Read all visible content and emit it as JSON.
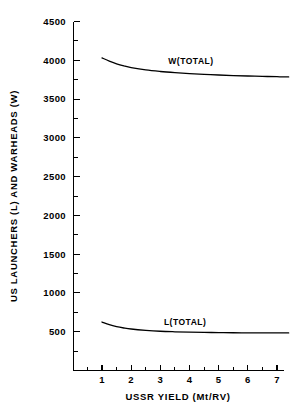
{
  "chart_data": {
    "type": "line",
    "title": "",
    "xlabel": "USSR YIELD (Mt/RV)",
    "ylabel": "US LAUNCHERS (L) AND WARHEADS (W)",
    "xlim": [
      0,
      7.45
    ],
    "ylim": [
      0,
      4500
    ],
    "grid": false,
    "legend_position": "inline-annotation",
    "x_ticks": [
      1,
      2,
      3,
      4,
      5,
      6,
      7
    ],
    "x_tick_labels": [
      "1",
      "2",
      "3",
      "4",
      "5",
      "6",
      "7"
    ],
    "x_minor_ticks": [
      0.5,
      1.5,
      2.5,
      3.5,
      4.5,
      5.5,
      6.5
    ],
    "y_ticks": [
      500,
      1000,
      1500,
      2000,
      2500,
      3000,
      3500,
      4000,
      4500
    ],
    "y_tick_labels": [
      "500",
      "1000",
      "1500",
      "2000",
      "2500",
      "3000",
      "3500",
      "4000",
      "4500"
    ],
    "y_minor_ticks": [
      250,
      750,
      1250,
      1750,
      2250,
      2750,
      3250,
      3750,
      4250
    ],
    "series": [
      {
        "name": "W(TOTAL)",
        "label": "W(TOTAL)",
        "label_x": 4.05,
        "label_y": 3950,
        "x": [
          1.0,
          1.25,
          1.5,
          1.75,
          2.0,
          2.5,
          3.0,
          3.5,
          4.0,
          4.5,
          5.0,
          5.5,
          6.0,
          6.5,
          7.0,
          7.4
        ],
        "values": [
          4030,
          3990,
          3955,
          3928,
          3906,
          3875,
          3855,
          3840,
          3828,
          3818,
          3810,
          3803,
          3797,
          3792,
          3788,
          3785
        ]
      },
      {
        "name": "L(TOTAL)",
        "label": "L(TOTAL)",
        "label_x": 3.85,
        "label_y": 590,
        "x": [
          1.0,
          1.25,
          1.5,
          1.75,
          2.0,
          2.5,
          3.0,
          3.5,
          4.0,
          4.5,
          5.0,
          5.5,
          6.0,
          6.5,
          7.0,
          7.4
        ],
        "values": [
          625,
          590,
          565,
          548,
          535,
          518,
          506,
          499,
          494,
          491,
          489,
          487,
          486,
          485,
          484,
          484
        ]
      }
    ]
  }
}
